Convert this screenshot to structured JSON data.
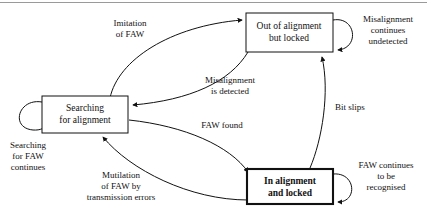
{
  "diagram": {
    "type": "state-transition-diagram",
    "states": [
      {
        "id": "searching",
        "label_lines": [
          "Searching",
          "for alignment"
        ],
        "emphasis": false,
        "x": 42,
        "y": 96,
        "w": 86,
        "h": 37
      },
      {
        "id": "out_of_alignment",
        "label_lines": [
          "Out of alignment",
          "but locked"
        ],
        "emphasis": false,
        "x": 246,
        "y": 13,
        "w": 87,
        "h": 39
      },
      {
        "id": "in_alignment",
        "label_lines": [
          "In alignment",
          "and locked"
        ],
        "emphasis": true,
        "x": 247,
        "y": 169,
        "w": 86,
        "h": 35
      }
    ],
    "transitions": [
      {
        "id": "imitation-of-faw",
        "from": "searching",
        "to": "out_of_alignment",
        "label_lines": [
          "Imitation",
          "of FAW"
        ],
        "label_x": 130,
        "label_y": 26
      },
      {
        "id": "misalignment-is-detected",
        "from": "out_of_alignment",
        "to": "searching",
        "label_lines": [
          "Misalignment",
          "is detected"
        ],
        "label_x": 230,
        "label_y": 83
      },
      {
        "id": "faw-found",
        "from": "searching",
        "to": "in_alignment",
        "label_lines": [
          "FAW found"
        ],
        "label_x": 222,
        "label_y": 128
      },
      {
        "id": "mutilation-of-faw",
        "from": "in_alignment",
        "to": "searching",
        "label_lines": [
          "Mutilation",
          "of FAW by",
          "transmission errors"
        ],
        "label_x": 121,
        "label_y": 178
      },
      {
        "id": "bit-slips",
        "from": "in_alignment",
        "to": "out_of_alignment",
        "label_lines": [
          "Bit slips"
        ],
        "label_x": 350,
        "label_y": 110
      }
    ],
    "self_loops": [
      {
        "id": "searching-for-faw-continues",
        "state": "searching",
        "label_lines": [
          "Searching",
          "for FAW",
          "continues"
        ],
        "label_x": 25,
        "label_y": 145
      },
      {
        "id": "misalignment-continues-undetected",
        "state": "out_of_alignment",
        "label_lines": [
          "Misalignment",
          "continues",
          "undetected"
        ],
        "label_x": 388,
        "label_y": 22
      },
      {
        "id": "faw-continues-to-be-recognised",
        "state": "in_alignment",
        "label_lines": [
          "FAW continues",
          "to be",
          "recognised"
        ],
        "label_x": 386,
        "label_y": 166
      }
    ],
    "colors": {
      "ink": "#111111",
      "background": "#ffffff",
      "scan_artifact": "#9a9a9a"
    }
  }
}
